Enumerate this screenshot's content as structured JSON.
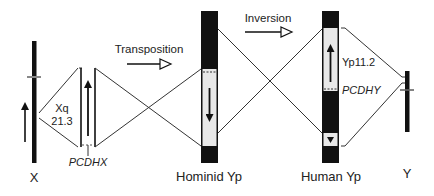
{
  "diagram": {
    "steps": [
      {
        "label": "Transposition"
      },
      {
        "label": "Inversion"
      }
    ],
    "chromosomes": [
      {
        "label": "X"
      },
      {
        "label": "Hominid Yp"
      },
      {
        "label": "Human Yp"
      },
      {
        "label": "Y"
      }
    ],
    "annotations": {
      "x_band_line1": "Xq",
      "x_band_line2": "21.3",
      "x_gene": "PCDHX",
      "y_band": "Yp11.2",
      "y_gene": "PCDHY"
    },
    "colors": {
      "chromosome": "#111111",
      "segment": "#e8e8e8",
      "line": "#333333"
    }
  }
}
